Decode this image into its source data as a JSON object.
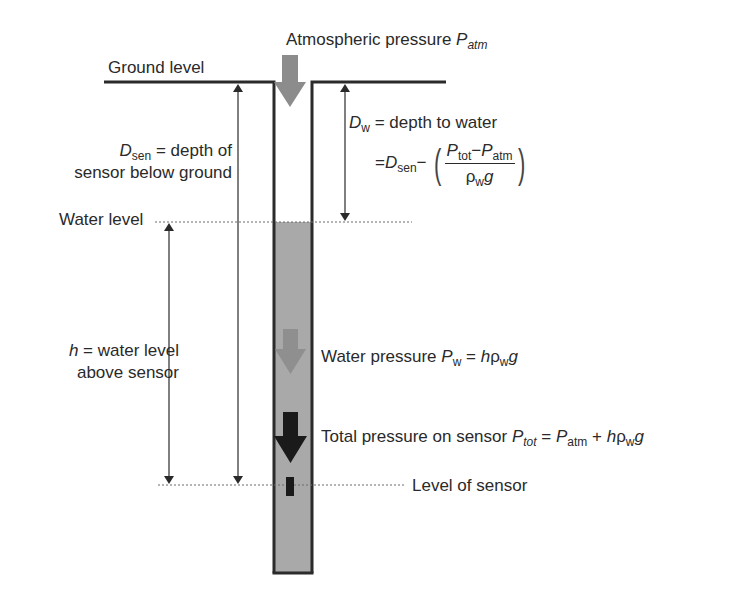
{
  "figure": {
    "type": "groundwater well pressure sensor diagram",
    "colors": {
      "water_fill": "#a9a9a9",
      "well_wall": "#2b2b2b",
      "atm_arrow": "#8c8c8c",
      "water_arrow": "#8f8f8f",
      "total_arrow": "#1a1a1a",
      "sensor": "#1a1a1a",
      "text": "#2a2a2a"
    }
  },
  "labels": {
    "atmospheric": {
      "text": "Atmospheric pressure ",
      "symbol": "P",
      "sub": "atm"
    },
    "ground_level": "Ground level",
    "water_level": "Water level",
    "level_of_sensor": "Level of sensor",
    "d_sen": {
      "symbol": "D",
      "sub": "sen",
      "line1_rest": " = depth of",
      "line2": "sensor below ground"
    },
    "h": {
      "symbol": "h",
      "line1_rest": " = water level",
      "line2": "above sensor"
    },
    "d_w": {
      "symbol": "D",
      "sub": "w",
      "line1_rest": " = depth to water",
      "eq_prefix": "=",
      "eq_D": "D",
      "eq_D_sub": "sen",
      "eq_minus": "−",
      "num_P1": "P",
      "num_P1_sub": "tot",
      "num_minus": "−",
      "num_P2": "P",
      "num_P2_sub": "atm",
      "den_rho": "ρ",
      "den_rho_sub": "w",
      "den_g": "g",
      "lparen": "(",
      "rparen": ")"
    },
    "water_pressure": {
      "text": "Water pressure ",
      "symbol": "P",
      "sub": "w",
      "eq": " = ",
      "h": "h",
      "rho": "ρ",
      "rho_sub": "w",
      "g": "g"
    },
    "total_pressure": {
      "text": "Total pressure on sensor ",
      "symbol": "P",
      "sub": "tot",
      "eq": " = ",
      "P2": "P",
      "P2_sub": "atm",
      "plus": " + ",
      "h": "h",
      "rho": "ρ",
      "rho_sub": "w",
      "g": "g"
    }
  },
  "icons": {
    "atm_arrow": "down-arrow-gray",
    "water_arrow": "down-arrow-gray-light",
    "total_arrow": "down-arrow-black",
    "sensor": "sensor-block"
  }
}
